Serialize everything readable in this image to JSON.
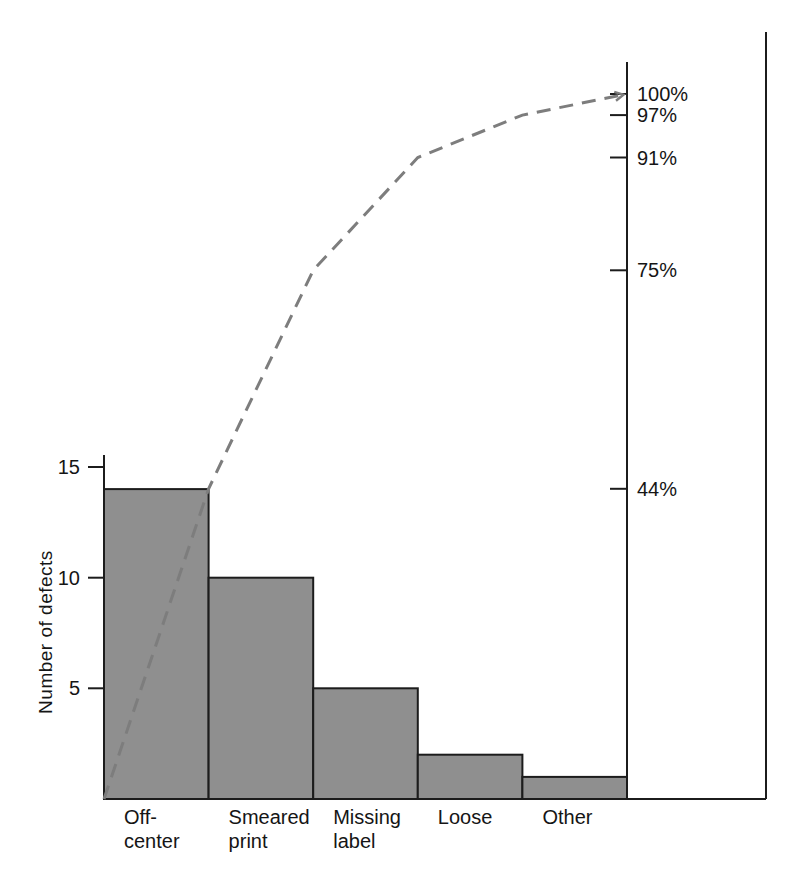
{
  "figure": {
    "background": "#ffffff"
  },
  "chart_data": {
    "type": "bar",
    "subtype": "pareto",
    "title": "",
    "categories": [
      "Off-center",
      "Smeared print",
      "Missing label",
      "Loose",
      "Other"
    ],
    "category_label_lines": [
      [
        "Off-",
        "center"
      ],
      [
        "Smeared",
        "print"
      ],
      [
        "Missing",
        "label"
      ],
      [
        "Loose"
      ],
      [
        "Other"
      ]
    ],
    "values": [
      14,
      10,
      5,
      2,
      1
    ],
    "total_defects": 32,
    "ylabel": "Number of defects",
    "yticks": [
      5,
      10,
      15
    ],
    "ylim": [
      0,
      15.5
    ],
    "series": [
      {
        "name": "Defect count",
        "type": "bar",
        "values": [
          14,
          10,
          5,
          2,
          1
        ]
      },
      {
        "name": "Cumulative percent",
        "type": "line",
        "style": "dashed",
        "values": [
          44,
          75,
          91,
          97,
          100
        ]
      }
    ],
    "percent_ticks": [
      44,
      75,
      91,
      97,
      100
    ],
    "percent_tick_labels": [
      "44%",
      "75%",
      "91%",
      "97%",
      "100%"
    ],
    "percent_axis_range": [
      0,
      104
    ],
    "grid": false,
    "legend": "none",
    "colors": {
      "bar_fill": "#8f8f8f",
      "bar_border": "#1c1c1c",
      "cumulative_line": "#7d7d7d",
      "axis": "#1c1c1c",
      "text": "#151515"
    }
  }
}
